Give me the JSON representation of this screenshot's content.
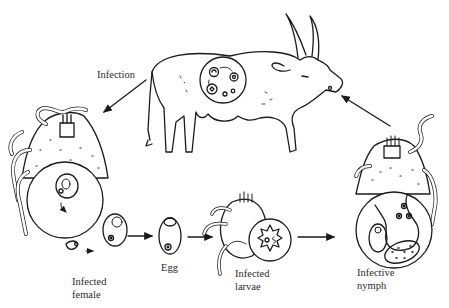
{
  "diagram": {
    "type": "life-cycle",
    "labels": {
      "infection": "Infection",
      "infected_female_1": "Infected",
      "infected_female_2": "female",
      "egg": "Egg",
      "infected_larvae_1": "Infected",
      "infected_larvae_2": "larvae",
      "infective_nymph_1": "Infective",
      "infective_nymph_2": "nymph"
    },
    "nodes": [
      "Host (cattle)",
      "Infected female",
      "Egg",
      "Infected larvae",
      "Infective nymph"
    ],
    "edges": [
      {
        "from": "Host (cattle)",
        "to": "Infected female",
        "label": "Infection"
      },
      {
        "from": "Infected female",
        "to": "Egg"
      },
      {
        "from": "Egg",
        "to": "Infected larvae"
      },
      {
        "from": "Infected larvae",
        "to": "Infective nymph"
      },
      {
        "from": "Infective nymph",
        "to": "Host (cattle)"
      }
    ],
    "colors": {
      "line": "#1a1a1a",
      "background": "#ffffff"
    }
  }
}
